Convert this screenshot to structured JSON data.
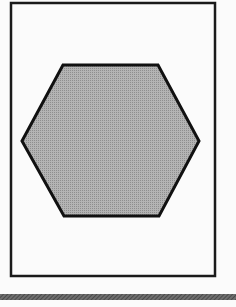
{
  "figure": {
    "frame": {
      "x": 11,
      "y": 3,
      "width": 204,
      "height": 273,
      "stroke": "#1a1a1a",
      "stroke_width": 2.5,
      "fill": "#fbfbfb"
    },
    "hexagon": {
      "points": [
        [
          63,
          65
        ],
        [
          158,
          65
        ],
        [
          199,
          141
        ],
        [
          159,
          216
        ],
        [
          64,
          216
        ],
        [
          22,
          141
        ]
      ],
      "fill": "#b4b4b4",
      "dot_color": "#8e8e8e",
      "stroke": "#111111",
      "stroke_width": 3
    },
    "bottom_bar": {
      "y": 294,
      "height": 6,
      "fill": "#6e6e6e",
      "hatch_color": "#4a4a4a"
    },
    "background": "#fbfbfb"
  },
  "labels": {
    "shape_name": "hexagon"
  }
}
